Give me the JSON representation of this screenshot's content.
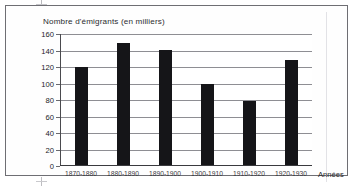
{
  "figure": {
    "frame_border_color": "#6e6e73",
    "background_color": "#ffffff"
  },
  "chart_data": {
    "type": "bar",
    "title": "Nombre d'émigrants (en milliers)",
    "subtitle": "",
    "xlabel": "Années",
    "ylabel": "Nombre d'émigrants (en milliers)",
    "categories": [
      "1870-1880",
      "1880-1890",
      "1890-1900",
      "1900-1910",
      "1910-1920",
      "1920-1930"
    ],
    "values": [
      119,
      148,
      139,
      98,
      77,
      127
    ],
    "series": [
      {
        "name": "Nombre d'émigrants (en milliers)",
        "values": [
          119,
          148,
          139,
          98,
          77,
          127
        ]
      }
    ],
    "ylim": [
      0,
      160
    ],
    "ytick_labels": [
      "0",
      "20",
      "40",
      "60",
      "80",
      "100",
      "120",
      "140",
      "160"
    ],
    "ytick_values": [
      0,
      20,
      40,
      60,
      80,
      100,
      120,
      140,
      160
    ],
    "grid": "horizontal",
    "legend": "none",
    "bar_color": "#151518",
    "gridline_color": "#8e8e93",
    "axis_color": "#3a3a3e"
  }
}
